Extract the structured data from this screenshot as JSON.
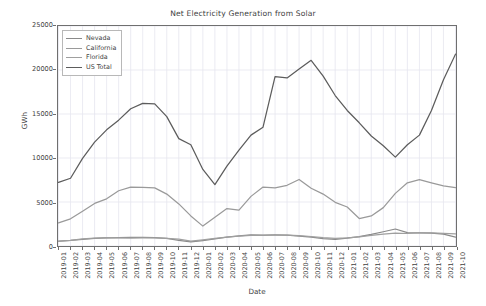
{
  "chart_data": {
    "type": "line",
    "title": "Net Electricity Generation from Solar",
    "xlabel": "Date",
    "ylabel": "GWh",
    "ylim": [
      0,
      25000
    ],
    "yticks": [
      0,
      5000,
      10000,
      15000,
      20000,
      25000
    ],
    "grid": true,
    "legend_position": "upper left",
    "categories": [
      "2019-01",
      "2019-02",
      "2019-03",
      "2019-04",
      "2019-05",
      "2019-06",
      "2019-07",
      "2019-08",
      "2019-09",
      "2019-10",
      "2019-11",
      "2019-12",
      "2020-01",
      "2020-02",
      "2020-03",
      "2020-04",
      "2020-05",
      "2020-06",
      "2020-07",
      "2020-08",
      "2020-09",
      "2020-10",
      "2020-11",
      "2020-12",
      "2021-01",
      "2021-02",
      "2021-03",
      "2021-04",
      "2021-05",
      "2021-06",
      "2021-07",
      "2021-08",
      "2021-09",
      "2021-10"
    ],
    "series": [
      {
        "name": "Nevada",
        "color": "#8a8a8a",
        "values": [
          560,
          640,
          760,
          880,
          930,
          960,
          980,
          980,
          940,
          870,
          640,
          470,
          620,
          800,
          1000,
          1150,
          1260,
          1250,
          1260,
          1230,
          1130,
          1000,
          840,
          760,
          900,
          1060,
          1320,
          1620,
          1930,
          1520,
          1500,
          1460,
          1340,
          1010
        ]
      },
      {
        "name": "California",
        "color": "#9a9a9a",
        "values": [
          2620,
          3090,
          3960,
          4840,
          5360,
          6280,
          6700,
          6660,
          6600,
          5900,
          4780,
          3420,
          2260,
          3280,
          4250,
          4080,
          5640,
          6700,
          6600,
          6900,
          7560,
          6560,
          5900,
          4960,
          4430,
          3120,
          3420,
          4360,
          5980,
          7180,
          7540,
          7180,
          6840,
          6640
        ]
      },
      {
        "name": "Florida",
        "color": "#9f9f9f",
        "values": [
          520,
          630,
          800,
          900,
          940,
          920,
          900,
          910,
          920,
          880,
          780,
          560,
          700,
          860,
          1020,
          1120,
          1220,
          1210,
          1240,
          1230,
          1180,
          1080,
          960,
          880,
          920,
          1040,
          1200,
          1340,
          1460,
          1420,
          1480,
          1480,
          1430,
          1370
        ]
      },
      {
        "name": "US Total",
        "color": "#5c5c5c",
        "values": [
          7230,
          7700,
          9960,
          11800,
          13200,
          14300,
          15600,
          16200,
          16150,
          14700,
          12200,
          11500,
          8700,
          6980,
          9080,
          10900,
          12600,
          13500,
          19250,
          19100,
          20100,
          21100,
          19300,
          17100,
          15400,
          14000,
          12500,
          11400,
          10100,
          11500,
          12600,
          15400,
          18900,
          21800
        ]
      }
    ],
    "series_reconstructed": [
      {
        "name": "US Total",
        "values_by_month": {
          "2019-01": 7230,
          "2019-02": 7700,
          "2019-03": 9960,
          "2019-04": 11800,
          "2019-05": 13200,
          "2019-06": 14300,
          "2019-07": 15600,
          "2019-08": 16200,
          "2019-09": 16150,
          "2019-10": 14700,
          "2019-11": 12200,
          "2019-12": 11500,
          "2020-01": 8700,
          "2020-02": 6980,
          "2020-03": 9080,
          "2020-04": 10900,
          "2020-05": 12600,
          "2020-06": 13500,
          "2020-07": 19250,
          "2020-08": 19100,
          "2020-09": 20100,
          "2020-10": 21100,
          "2020-11": 19300,
          "2020-12": 17100,
          "2021-01": 15400,
          "2021-02": 14000,
          "2021-03": 12500,
          "2021-04": 11400,
          "2021-05": 10100,
          "2021-06": 11500,
          "2021-07": 12600,
          "2021-08": 15400,
          "2021-09": 18900,
          "2021-10": 21800
        }
      }
    ]
  },
  "legend": {
    "entries": [
      {
        "label": "Nevada"
      },
      {
        "label": "California"
      },
      {
        "label": "Florida"
      },
      {
        "label": "US Total"
      }
    ]
  },
  "axes": {
    "ylabel": "GWh",
    "xlabel": "Date",
    "ytick_labels": [
      "0",
      "5000",
      "10000",
      "15000",
      "20000",
      "25000"
    ]
  },
  "colors": {
    "axis": "#6f6f6f",
    "grid": "#e6e6ef",
    "text": "#3f3f3f",
    "background": "#ffffff"
  }
}
